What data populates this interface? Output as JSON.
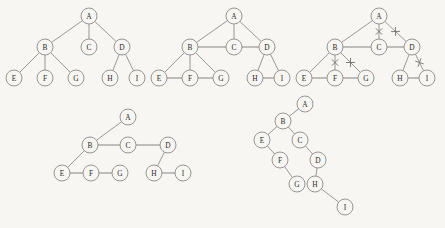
{
  "figure": {
    "background_color": "#f7f6f2",
    "ink_color": "#8a8a8a",
    "label_color": "#2b2b2b",
    "node_radius": 8,
    "panels": [
      {
        "id": "panel-general-tree",
        "name": "general-tree",
        "nodes": [
          {
            "id": "A",
            "label": "A",
            "x": 89,
            "y": 16
          },
          {
            "id": "B",
            "label": "B",
            "x": 45,
            "y": 47
          },
          {
            "id": "C",
            "label": "C",
            "x": 89,
            "y": 47
          },
          {
            "id": "D",
            "label": "D",
            "x": 122,
            "y": 47
          },
          {
            "id": "E",
            "label": "E",
            "x": 14,
            "y": 78
          },
          {
            "id": "F",
            "label": "F",
            "x": 45,
            "y": 78
          },
          {
            "id": "G",
            "label": "G",
            "x": 76,
            "y": 78
          },
          {
            "id": "H",
            "label": "H",
            "x": 110,
            "y": 78
          },
          {
            "id": "I",
            "label": "I",
            "x": 137,
            "y": 78
          }
        ],
        "edges": [
          {
            "from": "A",
            "to": "B",
            "kind": "parent"
          },
          {
            "from": "A",
            "to": "C",
            "kind": "parent"
          },
          {
            "from": "A",
            "to": "D",
            "kind": "parent"
          },
          {
            "from": "B",
            "to": "E",
            "kind": "parent"
          },
          {
            "from": "B",
            "to": "F",
            "kind": "parent"
          },
          {
            "from": "B",
            "to": "G",
            "kind": "parent"
          },
          {
            "from": "D",
            "to": "H",
            "kind": "parent"
          },
          {
            "from": "D",
            "to": "I",
            "kind": "parent"
          }
        ],
        "cuts": []
      },
      {
        "id": "panel-with-sibling-links",
        "name": "tree-with-sibling-links",
        "nodes": [
          {
            "id": "A",
            "label": "A",
            "x": 234,
            "y": 16
          },
          {
            "id": "B",
            "label": "B",
            "x": 190,
            "y": 47
          },
          {
            "id": "C",
            "label": "C",
            "x": 234,
            "y": 47
          },
          {
            "id": "D",
            "label": "D",
            "x": 267,
            "y": 47
          },
          {
            "id": "E",
            "label": "E",
            "x": 159,
            "y": 78
          },
          {
            "id": "F",
            "label": "F",
            "x": 190,
            "y": 78
          },
          {
            "id": "G",
            "label": "G",
            "x": 221,
            "y": 78
          },
          {
            "id": "H",
            "label": "H",
            "x": 255,
            "y": 78
          },
          {
            "id": "I",
            "label": "I",
            "x": 282,
            "y": 78
          }
        ],
        "edges": [
          {
            "from": "A",
            "to": "B",
            "kind": "parent"
          },
          {
            "from": "A",
            "to": "C",
            "kind": "parent"
          },
          {
            "from": "A",
            "to": "D",
            "kind": "parent"
          },
          {
            "from": "B",
            "to": "E",
            "kind": "parent"
          },
          {
            "from": "B",
            "to": "F",
            "kind": "parent"
          },
          {
            "from": "B",
            "to": "G",
            "kind": "parent"
          },
          {
            "from": "D",
            "to": "H",
            "kind": "parent"
          },
          {
            "from": "D",
            "to": "I",
            "kind": "parent"
          },
          {
            "from": "B",
            "to": "C",
            "kind": "sibling"
          },
          {
            "from": "C",
            "to": "D",
            "kind": "sibling"
          },
          {
            "from": "E",
            "to": "F",
            "kind": "sibling"
          },
          {
            "from": "F",
            "to": "G",
            "kind": "sibling"
          },
          {
            "from": "H",
            "to": "I",
            "kind": "sibling"
          }
        ],
        "cuts": []
      },
      {
        "id": "panel-cut-edges",
        "name": "tree-with-cut-parent-edges",
        "nodes": [
          {
            "id": "A",
            "label": "A",
            "x": 379,
            "y": 16
          },
          {
            "id": "B",
            "label": "B",
            "x": 335,
            "y": 47
          },
          {
            "id": "C",
            "label": "C",
            "x": 379,
            "y": 47
          },
          {
            "id": "D",
            "label": "D",
            "x": 412,
            "y": 47
          },
          {
            "id": "E",
            "label": "E",
            "x": 304,
            "y": 78
          },
          {
            "id": "F",
            "label": "F",
            "x": 335,
            "y": 78
          },
          {
            "id": "G",
            "label": "G",
            "x": 366,
            "y": 78
          },
          {
            "id": "H",
            "label": "H",
            "x": 400,
            "y": 78
          },
          {
            "id": "I",
            "label": "I",
            "x": 427,
            "y": 78
          }
        ],
        "edges": [
          {
            "from": "A",
            "to": "B",
            "kind": "parent"
          },
          {
            "from": "A",
            "to": "C",
            "kind": "parent"
          },
          {
            "from": "A",
            "to": "D",
            "kind": "parent"
          },
          {
            "from": "B",
            "to": "E",
            "kind": "parent"
          },
          {
            "from": "B",
            "to": "F",
            "kind": "parent"
          },
          {
            "from": "B",
            "to": "G",
            "kind": "parent"
          },
          {
            "from": "D",
            "to": "H",
            "kind": "parent"
          },
          {
            "from": "D",
            "to": "I",
            "kind": "parent"
          },
          {
            "from": "B",
            "to": "C",
            "kind": "sibling"
          },
          {
            "from": "C",
            "to": "D",
            "kind": "sibling"
          },
          {
            "from": "E",
            "to": "F",
            "kind": "sibling"
          },
          {
            "from": "F",
            "to": "G",
            "kind": "sibling"
          },
          {
            "from": "H",
            "to": "I",
            "kind": "sibling"
          }
        ],
        "cuts": [
          {
            "from": "A",
            "to": "C",
            "mark": "x"
          },
          {
            "from": "A",
            "to": "D",
            "mark": "x"
          },
          {
            "from": "B",
            "to": "F",
            "mark": "x"
          },
          {
            "from": "B",
            "to": "G",
            "mark": "x"
          },
          {
            "from": "D",
            "to": "I",
            "mark": "x"
          }
        ]
      },
      {
        "id": "panel-left-child-right-sibling",
        "name": "left-child-right-sibling-layout",
        "nodes": [
          {
            "id": "A",
            "label": "A",
            "x": 128,
            "y": 117
          },
          {
            "id": "B",
            "label": "B",
            "x": 90,
            "y": 145
          },
          {
            "id": "C",
            "label": "C",
            "x": 128,
            "y": 145
          },
          {
            "id": "D",
            "label": "D",
            "x": 168,
            "y": 145
          },
          {
            "id": "E",
            "label": "E",
            "x": 62,
            "y": 173
          },
          {
            "id": "F",
            "label": "F",
            "x": 91,
            "y": 173
          },
          {
            "id": "G",
            "label": "G",
            "x": 120,
            "y": 173
          },
          {
            "id": "H",
            "label": "H",
            "x": 154,
            "y": 173
          },
          {
            "id": "I",
            "label": "I",
            "x": 183,
            "y": 173
          }
        ],
        "edges": [
          {
            "from": "A",
            "to": "B",
            "kind": "parent"
          },
          {
            "from": "B",
            "to": "E",
            "kind": "parent"
          },
          {
            "from": "D",
            "to": "H",
            "kind": "parent"
          },
          {
            "from": "B",
            "to": "C",
            "kind": "sibling"
          },
          {
            "from": "C",
            "to": "D",
            "kind": "sibling"
          },
          {
            "from": "E",
            "to": "F",
            "kind": "sibling"
          },
          {
            "from": "F",
            "to": "G",
            "kind": "sibling"
          },
          {
            "from": "H",
            "to": "I",
            "kind": "sibling"
          }
        ],
        "cuts": []
      },
      {
        "id": "panel-binary-tree",
        "name": "rotated-binary-tree",
        "nodes": [
          {
            "id": "A",
            "label": "A",
            "x": 305,
            "y": 104
          },
          {
            "id": "B",
            "label": "B",
            "x": 283,
            "y": 121
          },
          {
            "id": "C",
            "label": "C",
            "x": 300,
            "y": 140
          },
          {
            "id": "E",
            "label": "E",
            "x": 262,
            "y": 140
          },
          {
            "id": "D",
            "label": "D",
            "x": 318,
            "y": 160
          },
          {
            "id": "F",
            "label": "F",
            "x": 280,
            "y": 160
          },
          {
            "id": "G",
            "label": "G",
            "x": 297,
            "y": 184
          },
          {
            "id": "H",
            "label": "H",
            "x": 315,
            "y": 184
          },
          {
            "id": "I",
            "label": "I",
            "x": 345,
            "y": 207
          }
        ],
        "edges": [
          {
            "from": "A",
            "to": "B",
            "kind": "parent"
          },
          {
            "from": "B",
            "to": "E",
            "kind": "parent"
          },
          {
            "from": "B",
            "to": "C",
            "kind": "parent"
          },
          {
            "from": "E",
            "to": "F",
            "kind": "parent"
          },
          {
            "from": "C",
            "to": "D",
            "kind": "parent"
          },
          {
            "from": "F",
            "to": "G",
            "kind": "parent"
          },
          {
            "from": "D",
            "to": "H",
            "kind": "parent"
          },
          {
            "from": "H",
            "to": "I",
            "kind": "parent"
          }
        ],
        "cuts": []
      }
    ]
  }
}
